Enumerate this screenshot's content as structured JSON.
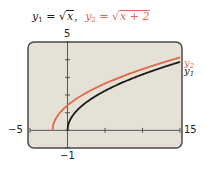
{
  "title": {
    "y1_label": "y",
    "y1_sub": "1",
    "y1_eq": " = ",
    "y1_radicand": "x",
    "y1_tail": ",",
    "y2_label": "y",
    "y2_sub": "2",
    "y2_eq": " = ",
    "y2_radicand": "x + 2"
  },
  "axes": {
    "ymax_label": "5",
    "ymin_label": "−1",
    "xmin_label": "−5",
    "xmax_label": "15"
  },
  "legend": {
    "y2": {
      "name": "y",
      "sub": "2"
    },
    "y1": {
      "name": "y",
      "sub": "1"
    }
  },
  "colors": {
    "y1": "#1a1a1a",
    "y2": "#e0694a",
    "screen_bg": "#e6e1d6",
    "frame": "#4a4a4a"
  },
  "chart_data": {
    "type": "line",
    "xlabel": "",
    "ylabel": "",
    "xlim": [
      -5,
      15
    ],
    "ylim": [
      -1,
      5
    ],
    "range_note": "xlim/ylim taken from the axis labels as the nominal window; pixel positions do not fully confirm this mapping (the 5 label sits above the frame edge)",
    "x_ticks": [
      -5,
      0,
      5,
      10,
      15
    ],
    "y_ticks": [
      -1,
      0,
      1,
      2,
      3,
      4,
      5
    ],
    "grid": false,
    "legend_position": "right end of curves",
    "series": [
      {
        "name": "y1 = √x",
        "color": "#1a1a1a",
        "x": [
          0,
          0.25,
          1,
          2,
          3,
          4,
          5,
          6,
          7,
          8,
          9,
          10,
          11,
          12,
          13,
          14,
          15
        ],
        "y": [
          0,
          0.5,
          1,
          1.41,
          1.73,
          2,
          2.24,
          2.45,
          2.65,
          2.83,
          3,
          3.16,
          3.32,
          3.46,
          3.61,
          3.74,
          3.87
        ]
      },
      {
        "name": "y2 = √(x + 2)",
        "color": "#e0694a",
        "x": [
          -2,
          -1.75,
          -1,
          0,
          1,
          2,
          3,
          4,
          5,
          6,
          7,
          8,
          9,
          10,
          11,
          12,
          13,
          14,
          15
        ],
        "y": [
          0,
          0.5,
          1,
          1.41,
          1.73,
          2,
          2.24,
          2.45,
          2.65,
          2.83,
          3,
          3.16,
          3.32,
          3.46,
          3.61,
          3.74,
          3.87,
          4,
          4.12
        ]
      }
    ]
  }
}
